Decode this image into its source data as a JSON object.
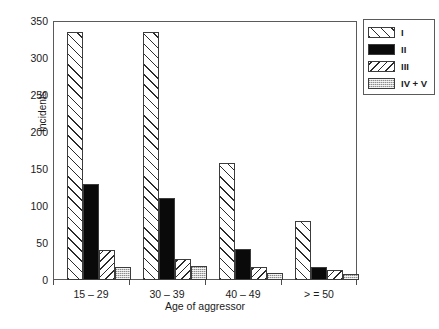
{
  "chart_data": {
    "type": "bar",
    "title": "",
    "xlabel": "Age of aggressor",
    "ylabel": "Incidents",
    "ylim": [
      0,
      350
    ],
    "yticks": [
      0,
      50,
      100,
      150,
      200,
      250,
      300,
      350
    ],
    "grid": false,
    "legend_position": "right-top",
    "categories": [
      "15 – 29",
      "30 – 39",
      "40 – 49",
      "> = 50"
    ],
    "series": [
      {
        "name": "I",
        "pattern": "diagonal-hatch-forward",
        "color": "#ffffff",
        "values": [
          335,
          335,
          158,
          80
        ]
      },
      {
        "name": "II",
        "pattern": "solid-black",
        "color": "#0a0a0a",
        "values": [
          130,
          111,
          42,
          17
        ]
      },
      {
        "name": "III",
        "pattern": "diagonal-hatch-back",
        "color": "#ffffff",
        "values": [
          40,
          28,
          17,
          14
        ]
      },
      {
        "name": "IV + V",
        "pattern": "stipple-gray",
        "color": "#c9c9c9",
        "values": [
          18,
          19,
          9,
          8
        ]
      }
    ]
  },
  "legend": {
    "entries": [
      {
        "label": "I"
      },
      {
        "label": "II"
      },
      {
        "label": "III"
      },
      {
        "label": "IV + V"
      }
    ]
  },
  "axes": {
    "y_tick_labels": [
      "0",
      "50",
      "100",
      "150",
      "200",
      "250",
      "300",
      "350"
    ],
    "y_title": "Incidents",
    "x_title": "Age of aggressor",
    "x_tick_labels": [
      "15 – 29",
      "30 – 39",
      "40 – 49",
      "> = 50"
    ]
  },
  "colors": {
    "axis": "#5a5a5a",
    "text": "#1a1a1a",
    "bar_outline": "#3c3c3c",
    "series_ii_fill": "#0a0a0a",
    "series_iv_fill": "#c9c9c9",
    "background": "#ffffff"
  }
}
